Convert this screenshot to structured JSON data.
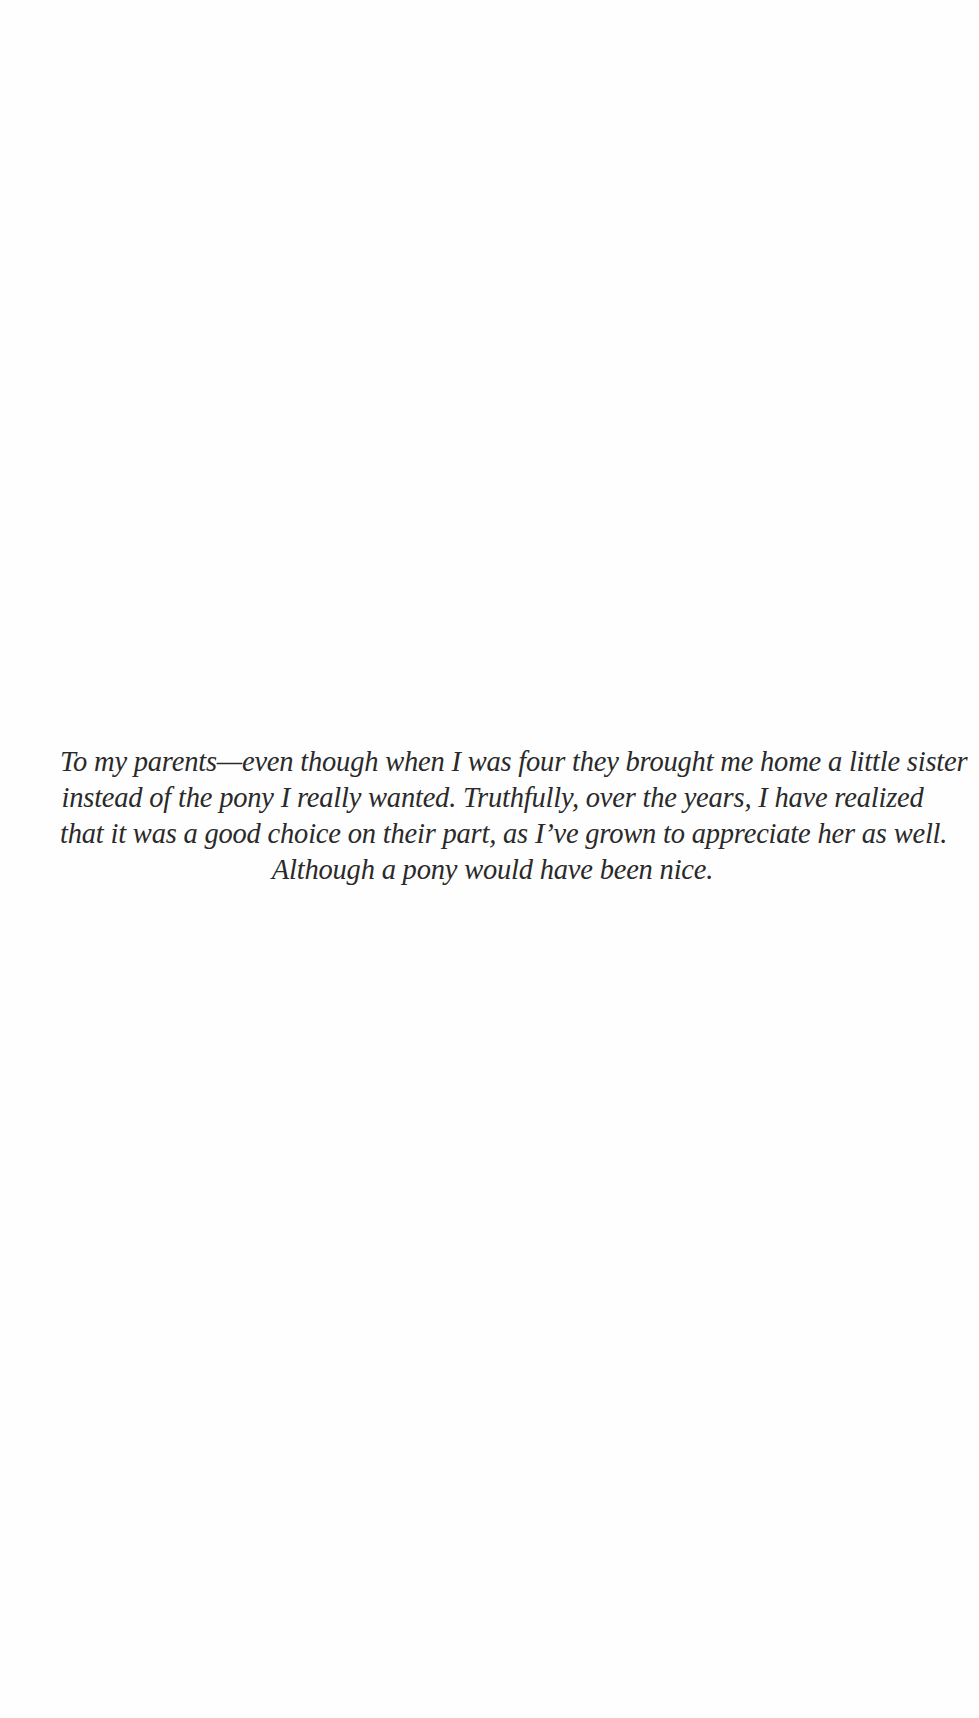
{
  "page": {
    "type": "dedication",
    "background": "#fefefe",
    "text_color": "#2a2a2a"
  },
  "dedication": {
    "lines": [
      "To my parents—even though when I was four they brought me home a little sister",
      "instead of the pony I really wanted. Truthfully, over the years, I have realized",
      "that it was a good choice on their part, as I’ve grown to appreciate her as well.",
      "Although a pony would have been nice."
    ]
  }
}
